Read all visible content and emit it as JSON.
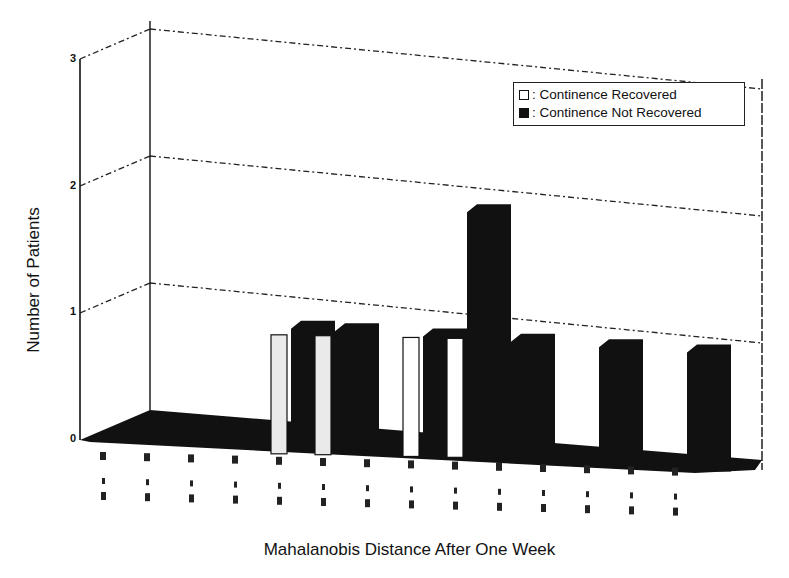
{
  "chart_data": {
    "type": "bar",
    "style": "3d-grouped",
    "title": "",
    "xlabel": "Mahalanobis Distance After One Week",
    "ylabel": "Number of Patients",
    "ylim": [
      0,
      3
    ],
    "yticks": [
      "0",
      "1",
      "2",
      "3"
    ],
    "grid": true,
    "legend_position": "top-right",
    "categories": [
      "bin 1",
      "bin 2",
      "bin 3",
      "bin 4",
      "bin 5",
      "bin 6",
      "bin 7",
      "bin 8",
      "bin 9",
      "bin 10",
      "bin 11",
      "bin 12",
      "bin 13",
      "bin 14"
    ],
    "series": [
      {
        "name": "Continence Recovered",
        "color": "#ffffff",
        "values": [
          0,
          0,
          0,
          0,
          1,
          1,
          0,
          1,
          1,
          0,
          0,
          0,
          0,
          0
        ]
      },
      {
        "name": "Continence Not Recovered",
        "color": "#111111",
        "values": [
          0,
          0,
          0,
          0,
          1,
          1,
          0,
          1,
          2,
          1,
          0,
          1,
          0,
          1
        ]
      }
    ],
    "note": "X tick labels are rotated range labels that are illegible in the scan"
  },
  "legend": {
    "items": [
      {
        "label": ": Continence Recovered",
        "fill": "#ffffff"
      },
      {
        "label": ": Continence Not Recovered",
        "fill": "#111111"
      }
    ]
  },
  "axis": {
    "y_title": "Number of Patients",
    "x_title": "Mahalanobis Distance After One Week",
    "y_ticks": [
      "0",
      "1",
      "2",
      "3"
    ]
  }
}
